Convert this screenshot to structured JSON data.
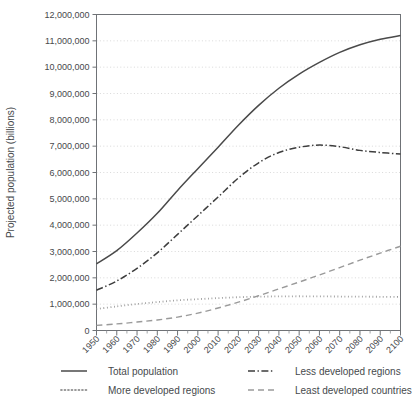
{
  "chart_data": {
    "type": "line",
    "title": "",
    "xlabel": "",
    "ylabel": "Projected population (billions)",
    "xlim": [
      1950,
      2100
    ],
    "ylim": [
      0,
      12000000
    ],
    "ytick_step": 1000000,
    "grid": true,
    "legend_position": "bottom",
    "x": [
      1950,
      1960,
      1970,
      1980,
      1990,
      2000,
      2010,
      2020,
      2030,
      2040,
      2050,
      2060,
      2070,
      2080,
      2090,
      2100
    ],
    "xtick_labels": [
      "1950",
      "1960",
      "1970",
      "1980",
      "1990",
      "2000",
      "2010",
      "2020",
      "2030",
      "2040",
      "2050",
      "2060",
      "2070",
      "2080",
      "2090",
      "2100"
    ],
    "ytick_labels": [
      "0",
      "1,000,000",
      "2,000,000",
      "3,000,000",
      "4,000,000",
      "5,000,000",
      "6,000,000",
      "7,000,000",
      "8,000,000",
      "9,000,000",
      "10,000,000",
      "11,000,000",
      "12,000,000"
    ],
    "ytick_values": [
      0,
      1000000,
      2000000,
      3000000,
      4000000,
      5000000,
      6000000,
      7000000,
      8000000,
      9000000,
      10000000,
      11000000,
      12000000
    ],
    "series": [
      {
        "name": "Total population",
        "style": "solid",
        "color": "#4a4a4a",
        "width": 1.5,
        "values": [
          2530000,
          3030000,
          3700000,
          4450000,
          5320000,
          6145000,
          6960000,
          7795000,
          8550000,
          9200000,
          9735000,
          10180000,
          10560000,
          10850000,
          11060000,
          11200000
        ]
      },
      {
        "name": "Less developed regions",
        "style": "dashdot",
        "color": "#3d3d3d",
        "width": 1.5,
        "values": [
          1530000,
          1880000,
          2360000,
          2950000,
          3650000,
          4360000,
          5070000,
          5790000,
          6370000,
          6760000,
          6960000,
          7040000,
          6980000,
          6840000,
          6760000,
          6700000
        ]
      },
      {
        "name": "More developed regions",
        "style": "dotted",
        "color": "#9a9a9a",
        "width": 1.8,
        "values": [
          815000,
          915000,
          1005000,
          1080000,
          1145000,
          1190000,
          1230000,
          1265000,
          1285000,
          1295000,
          1300000,
          1295000,
          1290000,
          1285000,
          1280000,
          1275000
        ]
      },
      {
        "name": "Least developed countries",
        "style": "dashed",
        "color": "#9a9a9a",
        "width": 1.4,
        "values": [
          195000,
          250000,
          320000,
          400000,
          510000,
          660000,
          855000,
          1075000,
          1320000,
          1580000,
          1840000,
          2110000,
          2390000,
          2670000,
          2940000,
          3200000
        ]
      }
    ]
  },
  "legend": {
    "entries": [
      {
        "label": "Total population",
        "style": "solid",
        "color": "#4a4a4a"
      },
      {
        "label": "Less developed regions",
        "style": "dashdot",
        "color": "#3d3d3d"
      },
      {
        "label": "More developed regions",
        "style": "dotted",
        "color": "#9a9a9a"
      },
      {
        "label": "Least developed countries",
        "style": "dashed",
        "color": "#9a9a9a"
      }
    ]
  }
}
